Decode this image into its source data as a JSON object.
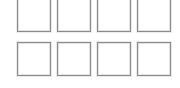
{
  "grid": {
    "rows": 2,
    "columns": 4,
    "border_color": "#8a8a8a",
    "background_color": "#ffffff",
    "tiles": [
      {
        "row": 1,
        "col": 1,
        "state": "empty"
      },
      {
        "row": 1,
        "col": 2,
        "state": "empty"
      },
      {
        "row": 1,
        "col": 3,
        "state": "empty"
      },
      {
        "row": 1,
        "col": 4,
        "state": "empty"
      },
      {
        "row": 2,
        "col": 1,
        "state": "empty"
      },
      {
        "row": 2,
        "col": 2,
        "state": "empty"
      },
      {
        "row": 2,
        "col": 3,
        "state": "empty"
      },
      {
        "row": 2,
        "col": 4,
        "state": "empty"
      }
    ]
  }
}
